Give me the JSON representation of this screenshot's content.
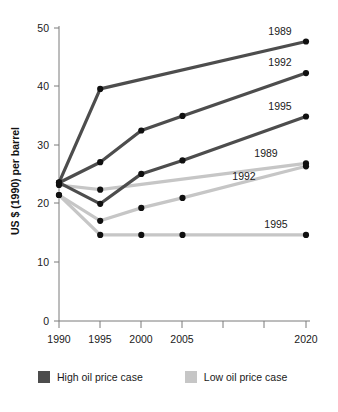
{
  "chart_data": {
    "type": "line",
    "title": "",
    "subtitle": "",
    "xlabel": "",
    "ylabel": "US $ (1990) per barrel",
    "x": [
      1990,
      1995,
      2000,
      2005,
      2020
    ],
    "xtick_labels": [
      "1990",
      "1995",
      "2000",
      "2005",
      "",
      "",
      "2020"
    ],
    "xtick_values": [
      1990,
      1995,
      2000,
      2005,
      2010,
      2015,
      2020
    ],
    "ytick_labels": [
      "0",
      "10",
      "20",
      "30",
      "40",
      "50"
    ],
    "ytick_values": [
      0,
      10,
      20,
      30,
      40,
      50
    ],
    "xlim": [
      1990,
      2020
    ],
    "ylim": [
      0,
      50
    ],
    "grid": false,
    "legend_position": "bottom",
    "series": [
      {
        "name": "1989",
        "group": "High oil price case",
        "color": "#4d4d4d",
        "label": "1989",
        "x": [
          1990,
          1995,
          2020
        ],
        "values": [
          23.6,
          39.6,
          47.7
        ]
      },
      {
        "name": "1992",
        "group": "High oil price case",
        "color": "#4d4d4d",
        "label": "1992",
        "x": [
          1990,
          1995,
          2000,
          2005,
          2020
        ],
        "values": [
          23.6,
          27.1,
          32.5,
          35.0,
          42.3
        ]
      },
      {
        "name": "1995",
        "group": "High oil price case",
        "color": "#4d4d4d",
        "label": "1995",
        "x": [
          1990,
          1995,
          2000,
          2005,
          2020
        ],
        "values": [
          23.6,
          20.0,
          25.1,
          27.4,
          34.9
        ]
      },
      {
        "name": "1989",
        "group": "Low oil price case",
        "color": "#c6c6c6",
        "label": "1989",
        "x": [
          1990,
          1995,
          2020
        ],
        "values": [
          23.2,
          22.4,
          26.9
        ]
      },
      {
        "name": "1992",
        "group": "Low oil price case",
        "color": "#c6c6c6",
        "label": "1992",
        "x": [
          1990,
          1995,
          2000,
          2005,
          2020
        ],
        "values": [
          21.5,
          17.1,
          19.3,
          21.0,
          26.4
        ]
      },
      {
        "name": "1995",
        "group": "Low oil price case",
        "color": "#c6c6c6",
        "label": "1995",
        "x": [
          1990,
          1995,
          2000,
          2005,
          2020
        ],
        "values": [
          21.5,
          14.7,
          14.7,
          14.7,
          14.7
        ]
      }
    ],
    "annotations": [
      {
        "text": "1989",
        "series": "high-1989",
        "x": 2020,
        "y": 47.7
      },
      {
        "text": "1992",
        "series": "high-1992",
        "x": 2020,
        "y": 42.3
      },
      {
        "text": "1995",
        "series": "high-1995",
        "x": 2020,
        "y": 34.9
      },
      {
        "text": "1989",
        "series": "low-1989",
        "x": 2020,
        "y": 26.9
      },
      {
        "text": "1992",
        "series": "low-1992",
        "x": 2020,
        "y": 26.4
      },
      {
        "text": "1995",
        "series": "low-1995",
        "x": 2020,
        "y": 14.7
      }
    ],
    "legend": [
      {
        "label": "High oil price case",
        "color": "#4d4d4d"
      },
      {
        "label": "Low oil price case",
        "color": "#c6c6c6"
      }
    ]
  },
  "axis": {
    "y_title": "US $ (1990) per barrel",
    "y_ticks": [
      "50",
      "40",
      "30",
      "20",
      "10",
      "0"
    ],
    "x_ticks": [
      "1990",
      "1995",
      "2000",
      "2005",
      "2020"
    ]
  },
  "series_labels": {
    "high_1989": "1989",
    "high_1992": "1992",
    "high_1995": "1995",
    "low_1989": "1989",
    "low_1992": "1992",
    "low_1995": "1995"
  },
  "legend": {
    "high_label": "High oil price case",
    "low_label": "Low oil price case"
  },
  "colors": {
    "high": "#4d4d4d",
    "low": "#c6c6c6",
    "marker": "#101010",
    "axis": "#7a7a7a",
    "text": "#1a1a1a",
    "background": "#ffffff"
  }
}
